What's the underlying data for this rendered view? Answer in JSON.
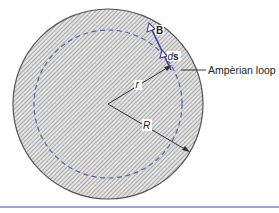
{
  "diagram": {
    "labels": {
      "B": "B",
      "ds_d": "d",
      "ds_s": "s",
      "r": "r",
      "R": "R",
      "amperian_loop": "Ampèrian loop"
    },
    "geometry": {
      "center": [
        108,
        104
      ],
      "outer_radius": 95,
      "amperian_radius": 74
    },
    "colors": {
      "hatch_bg": "#d9d9d9",
      "hatch_line": "#8a8a8a",
      "outline": "#555555",
      "loop_dash": "#5a63a8",
      "vector": "#3a3f9a",
      "radius_line": "#333333",
      "bottom_rule": "#9aa6d8"
    }
  }
}
